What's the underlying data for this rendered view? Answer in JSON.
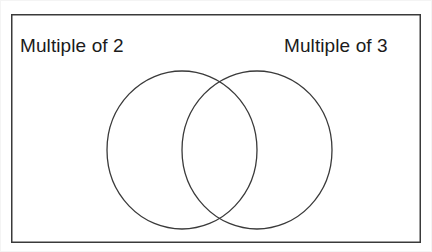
{
  "figure": {
    "type": "venn-diagram",
    "title": "",
    "background_color": "#ffffff",
    "stroke_color": "#3a3a3a",
    "text_color": "#1b1b1b",
    "universe_box": {
      "name": "universal-set-rectangle",
      "x": 11,
      "y": 14,
      "width": 410,
      "height": 229,
      "stroke_width": 1.5
    },
    "sets": [
      {
        "id": "set-left",
        "label": "Multiple of 2",
        "label_position": "top-left",
        "center_x": 182,
        "center_y": 150,
        "radius_x": 75,
        "radius_y": 79,
        "stroke_width": 1.3,
        "fill": "none",
        "items": []
      },
      {
        "id": "set-right",
        "label": "Multiple of 3",
        "label_position": "top-right",
        "center_x": 257,
        "center_y": 150,
        "radius_x": 75,
        "radius_y": 79,
        "stroke_width": 1.3,
        "fill": "none",
        "items": []
      }
    ],
    "regions": {
      "left_only": [],
      "intersection": [],
      "right_only": [],
      "outside": []
    }
  }
}
